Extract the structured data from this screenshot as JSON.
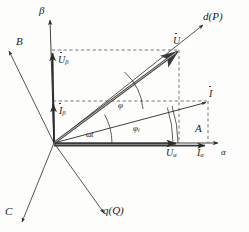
{
  "diagram": {
    "background_color": "#fdfdfc",
    "ink_color": "#1a1a1a",
    "origin": {
      "x": 54,
      "y": 143
    },
    "axes": [
      {
        "name": "alpha-axis",
        "label": "A",
        "sublabel": "α",
        "angle_deg": 0
      },
      {
        "name": "beta-axis",
        "label": "β",
        "sublabel": "",
        "angle_deg": 90
      },
      {
        "name": "b-phase-axis",
        "label": "B",
        "sublabel": "",
        "angle_deg": 120
      },
      {
        "name": "c-phase-axis",
        "label": "C",
        "sublabel": "",
        "angle_deg": 240
      },
      {
        "name": "d-axis",
        "label": "d(P)",
        "sublabel": "",
        "angle_deg": 40
      },
      {
        "name": "q-axis",
        "label": "q(Q)",
        "sublabel": "",
        "angle_deg": -50
      }
    ],
    "vectors": [
      {
        "name": "voltage-phasor",
        "label": "U",
        "dot": true,
        "angle_deg": 40
      },
      {
        "name": "current-phasor",
        "label": "I",
        "dot": true,
        "angle_deg": 17
      },
      {
        "name": "voltage-beta-component",
        "label": "U",
        "subscript": "β",
        "dot": true
      },
      {
        "name": "current-beta-component",
        "label": "I",
        "subscript": "β",
        "dot": true
      },
      {
        "name": "voltage-alpha-component",
        "label": "U",
        "subscript": "α",
        "dot": true
      },
      {
        "name": "current-alpha-component",
        "label": "I",
        "subscript": "α",
        "dot": true
      }
    ],
    "angles": [
      {
        "name": "omega-t-angle",
        "label": "ωt",
        "between": "alpha-axis and current-phasor"
      },
      {
        "name": "phi-angle",
        "label": "φ",
        "between": "current-phasor and voltage-phasor"
      },
      {
        "name": "phi-i-angle",
        "label": "φ",
        "subscript": "i",
        "between": "alpha-axis and current-phasor"
      }
    ],
    "labels": {
      "axis_A": "A",
      "axis_alpha": "α",
      "axis_beta": "β",
      "axis_B": "B",
      "axis_C": "C",
      "axis_d": "d(P)",
      "axis_q": "q(Q)",
      "vec_U": "U",
      "vec_I": "I",
      "vec_U_base": "U",
      "vec_U_sub_beta": "β",
      "vec_I_base": "I",
      "vec_I_sub_beta": "β",
      "vec_U_sub_alpha": "α",
      "vec_I_sub_alpha": "α",
      "ang_omega_t": "ωt",
      "ang_phi": "φ",
      "ang_phi_i_base": "φ",
      "ang_phi_i_sub": "i"
    }
  }
}
